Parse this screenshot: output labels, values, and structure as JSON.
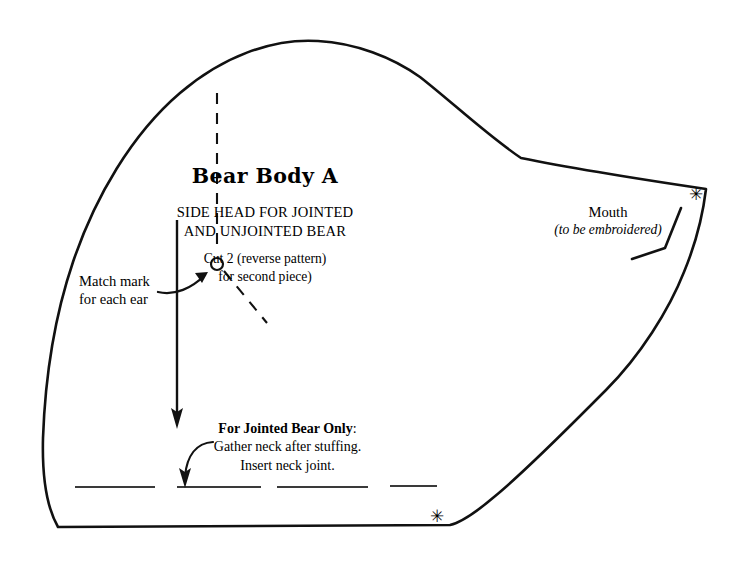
{
  "document": {
    "kind": "sewing-pattern-sheet",
    "background_color": "#ffffff",
    "ink_color": "#000000"
  },
  "title_block": {
    "title": "Bear Body A",
    "subtitle_line1": "SIDE HEAD FOR JOINTED",
    "subtitle_line2": "AND UNJOINTED BEAR",
    "cut_line1": "Cut 2 (reverse pattern)",
    "cut_line2": "for second piece)"
  },
  "match_mark": {
    "line1": "Match mark",
    "line2": "for each ear"
  },
  "mouth": {
    "label": "Mouth",
    "note": "(to be embroidered)"
  },
  "jointed": {
    "heading": "For Jointed Bear Only",
    "heading_suffix": ":",
    "line1": "Gather neck after stuffing.",
    "line2": "Insert neck joint."
  },
  "markers": {
    "asterisk_glyph": "✳",
    "asterisk_snout_name": "snout-match-asterisk",
    "asterisk_neck_name": "neck-match-asterisk"
  },
  "geometry": {
    "outline_path": "M 58 527 C 44 500 42 468 44 424 C 47 352 60 276 92 204 C 124 132 180 74 240 52 C 283 36 330 36 372 50 C 396 58 412 66 422 76 C 455 108 492 140 521 157 C 560 166 640 178 706 189 C 704 212 697 240 686 268 C 672 306 645 352 610 386 C 575 420 530 462 492 494 C 472 511 458 521 450 525 Z",
    "head_apex": [
      320,
      41
    ],
    "snout_tip": [
      706,
      189
    ],
    "neck_corner": [
      450,
      525
    ],
    "left_bulge": [
      44,
      424
    ]
  },
  "annotations": {
    "ear_dashed_vertical": {
      "x": 217,
      "y1": 93,
      "y2": 252
    },
    "ear_dashed_diagonal": {
      "x1": 224,
      "y1": 271,
      "x2": 266,
      "y2": 322
    },
    "match_circle": {
      "cx": 217,
      "cy": 264,
      "r": 6
    },
    "fold_arrow": {
      "x": 177,
      "y1": 220,
      "y2": 427
    },
    "neck_dashes": [
      [
        75,
        155
      ],
      [
        177,
        261
      ],
      [
        277,
        368
      ],
      [
        390,
        437
      ]
    ],
    "neck_dash_y": 487,
    "mouth_leader": [
      [
        681,
        208
      ],
      [
        665,
        248
      ],
      [
        632,
        259
      ]
    ]
  }
}
